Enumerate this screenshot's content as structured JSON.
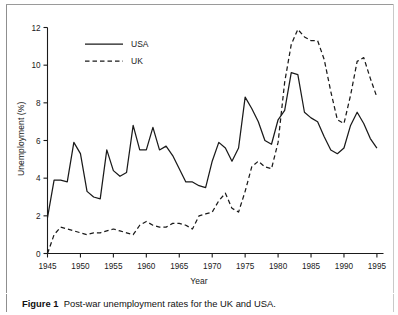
{
  "figure": {
    "caption_label": "Figure 1",
    "caption_text": "Post-war unemployment rates for the UK and USA.",
    "border_color": "#8f8f8f"
  },
  "chart_data": {
    "type": "line",
    "title": "",
    "xlabel": "Year",
    "ylabel": "Unemployment (%)",
    "xlim": [
      1945,
      1996
    ],
    "ylim": [
      0,
      12
    ],
    "xticks": [
      1945,
      1950,
      1955,
      1960,
      1965,
      1970,
      1975,
      1980,
      1985,
      1990,
      1995
    ],
    "xticklabels": [
      "1945",
      "1950",
      "1955",
      "1960",
      "1965",
      "1970",
      "1975",
      "1980",
      "1985",
      "1990",
      "1995"
    ],
    "yticks": [
      0,
      2,
      4,
      6,
      8,
      10,
      12
    ],
    "yticklabels": [
      "0",
      "2",
      "4",
      "6",
      "8",
      "10",
      "12"
    ],
    "grid": false,
    "legend_position": "upper-left",
    "line_color": "#1a1a1a",
    "x": [
      1945,
      1946,
      1947,
      1948,
      1949,
      1950,
      1951,
      1952,
      1953,
      1954,
      1955,
      1956,
      1957,
      1958,
      1959,
      1960,
      1961,
      1962,
      1963,
      1964,
      1965,
      1966,
      1967,
      1968,
      1969,
      1970,
      1971,
      1972,
      1973,
      1974,
      1975,
      1976,
      1977,
      1978,
      1979,
      1980,
      1981,
      1982,
      1983,
      1984,
      1985,
      1986,
      1987,
      1988,
      1989,
      1990,
      1991,
      1992,
      1993,
      1994,
      1995
    ],
    "series": [
      {
        "name": "USA",
        "style": "solid",
        "values": [
          1.9,
          3.9,
          3.9,
          3.8,
          5.9,
          5.3,
          3.3,
          3.0,
          2.9,
          5.5,
          4.4,
          4.1,
          4.3,
          6.8,
          5.5,
          5.5,
          6.7,
          5.5,
          5.7,
          5.2,
          4.5,
          3.8,
          3.8,
          3.6,
          3.5,
          4.9,
          5.9,
          5.6,
          4.9,
          5.6,
          8.3,
          7.7,
          7.0,
          6.0,
          5.8,
          7.1,
          7.6,
          9.6,
          9.5,
          7.5,
          7.2,
          7.0,
          6.2,
          5.5,
          5.3,
          5.6,
          6.8,
          7.5,
          6.9,
          6.1,
          5.6
        ],
        "marker": "none",
        "peak": {
          "year": 1982,
          "value": 9.6
        }
      },
      {
        "name": "UK",
        "style": "dashed",
        "values": [
          0.0,
          1.0,
          1.4,
          1.3,
          1.2,
          1.1,
          1.0,
          1.1,
          1.1,
          1.2,
          1.3,
          1.2,
          1.1,
          1.0,
          1.5,
          1.7,
          1.5,
          1.4,
          1.4,
          1.6,
          1.6,
          1.5,
          1.3,
          2.0,
          2.1,
          2.2,
          2.8,
          3.2,
          2.4,
          2.2,
          3.3,
          4.6,
          4.9,
          4.6,
          4.5,
          5.9,
          9.1,
          11.1,
          11.9,
          11.5,
          11.3,
          11.3,
          10.3,
          8.6,
          7.1,
          6.9,
          8.4,
          10.2,
          10.4,
          9.3,
          8.3
        ],
        "marker": "none",
        "peak": {
          "year": 1983,
          "value": 11.9
        }
      }
    ],
    "legend_entries": [
      {
        "label": "USA",
        "style": "solid"
      },
      {
        "label": "UK",
        "style": "dashed"
      }
    ]
  }
}
